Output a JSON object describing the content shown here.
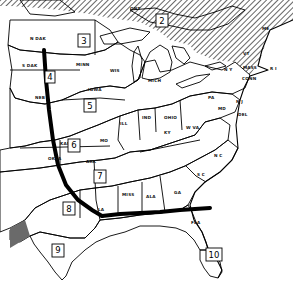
{
  "map": {
    "title": "",
    "colors": {
      "background": "#ffffff",
      "ink": "#000000",
      "light_gray": "#c8c8c8",
      "mid_gray": "#a8a8a8",
      "dark_gray": "#6a6a6a"
    },
    "zones": [
      {
        "number": "2",
        "pattern": "diagonal-stripes",
        "x": 162,
        "y": 21
      },
      {
        "number": "3",
        "pattern": "blank",
        "x": 84,
        "y": 41
      },
      {
        "number": "4",
        "pattern": "diagonal-stripes",
        "x": 50,
        "y": 77
      },
      {
        "number": "5",
        "pattern": "fine-dots",
        "x": 90,
        "y": 106
      },
      {
        "number": "6",
        "pattern": "horizontal-lines",
        "x": 74,
        "y": 145
      },
      {
        "number": "7",
        "pattern": "crosshatch-dark",
        "x": 100,
        "y": 176
      },
      {
        "number": "8",
        "pattern": "gray-fill",
        "x": 69,
        "y": 209
      },
      {
        "number": "9",
        "pattern": "coarse-dots",
        "x": 58,
        "y": 250
      },
      {
        "number": "10",
        "pattern": "vertical-stripes",
        "x": 214,
        "y": 255
      }
    ],
    "state_labels": [
      {
        "text": "N DAK",
        "x": 30,
        "y": 40
      },
      {
        "text": "ONT",
        "x": 130,
        "y": 10
      },
      {
        "text": "S DAK",
        "x": 25,
        "y": 67
      },
      {
        "text": "MINN",
        "x": 78,
        "y": 66
      },
      {
        "text": "WIS",
        "x": 112,
        "y": 72
      },
      {
        "text": "NEB",
        "x": 37,
        "y": 99
      },
      {
        "text": "IOWA",
        "x": 90,
        "y": 91
      },
      {
        "text": "MICH",
        "x": 150,
        "y": 82
      },
      {
        "text": "ILL",
        "x": 121,
        "y": 125
      },
      {
        "text": "IND",
        "x": 143,
        "y": 119
      },
      {
        "text": "OHIO",
        "x": 167,
        "y": 119
      },
      {
        "text": "PA",
        "x": 209,
        "y": 99
      },
      {
        "text": "N Y",
        "x": 226,
        "y": 71
      },
      {
        "text": "ME",
        "x": 265,
        "y": 30
      },
      {
        "text": "VT",
        "x": 244,
        "y": 55
      },
      {
        "text": "MASS",
        "x": 246,
        "y": 69
      },
      {
        "text": "R I",
        "x": 270,
        "y": 70
      },
      {
        "text": "CONN",
        "x": 244,
        "y": 80
      },
      {
        "text": "N J",
        "x": 237,
        "y": 103
      },
      {
        "text": "DEL",
        "x": 240,
        "y": 116
      },
      {
        "text": "MD",
        "x": 219,
        "y": 110
      },
      {
        "text": "W VA",
        "x": 188,
        "y": 129
      },
      {
        "text": "VA",
        "x": 213,
        "y": 134
      },
      {
        "text": "KY",
        "x": 166,
        "y": 134
      },
      {
        "text": "MO",
        "x": 103,
        "y": 142
      },
      {
        "text": "KANS",
        "x": 62,
        "y": 145
      },
      {
        "text": "OKLA",
        "x": 51,
        "y": 160
      },
      {
        "text": "ARK",
        "x": 89,
        "y": 163
      },
      {
        "text": "TENN",
        "x": 145,
        "y": 162
      },
      {
        "text": "N C",
        "x": 216,
        "y": 157
      },
      {
        "text": "S C",
        "x": 199,
        "y": 176
      },
      {
        "text": "MISS",
        "x": 125,
        "y": 196
      },
      {
        "text": "ALA",
        "x": 148,
        "y": 198
      },
      {
        "text": "GA",
        "x": 176,
        "y": 194
      },
      {
        "text": "LA",
        "x": 100,
        "y": 211
      },
      {
        "text": "TEXAS",
        "x": 55,
        "y": 225
      },
      {
        "text": "FLA",
        "x": 193,
        "y": 224
      }
    ],
    "boundary_lines": [
      {
        "name": "west-boundary",
        "description": "thick black line running south from the Dakotas to Louisiana"
      },
      {
        "name": "south-boundary",
        "description": "thick black line running east from Louisiana to Georgia coast"
      }
    ]
  }
}
